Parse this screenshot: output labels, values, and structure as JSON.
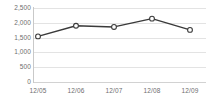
{
  "chart_data": {
    "type": "line",
    "title": "",
    "xlabel": "",
    "ylabel": "",
    "categories": [
      "12/05",
      "12/06",
      "12/07",
      "12/08",
      "12/09"
    ],
    "values": [
      1540,
      1900,
      1860,
      2140,
      1760
    ],
    "series": [
      {
        "name": "series-1",
        "values": [
          1540,
          1900,
          1860,
          2140,
          1760
        ]
      }
    ],
    "ylim": [
      0,
      2500
    ],
    "y_ticks": [
      0,
      500,
      1000,
      1500,
      2000,
      2500
    ],
    "y_tick_labels": [
      "0",
      "500",
      "1,000",
      "1,500",
      "2,000",
      "2,500"
    ],
    "x_tick_labels": [
      "12/05",
      "12/06",
      "12/07",
      "12/08",
      "12/09"
    ],
    "grid": true,
    "grid_axis": "y",
    "legend": false,
    "legend_position": "none",
    "marker": "open-circle",
    "colors": {
      "line": "#3a3a3a",
      "marker_fill": "#ffffff",
      "marker_stroke": "#3a3a3a",
      "gridline": "#e3e3e3",
      "axis": "#c9c9c9",
      "tick_label": "#6e6e6e",
      "background": "#ffffff"
    }
  }
}
